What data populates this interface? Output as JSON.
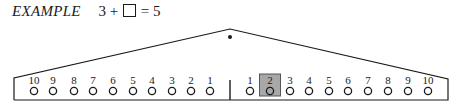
{
  "title": {
    "label": "EXAMPLE",
    "equation": {
      "left": "3",
      "op": "+",
      "blank": "□",
      "eq": "=",
      "result": "5"
    }
  },
  "balance": {
    "apex": [
      230,
      29
    ],
    "pivot_dot": [
      230,
      37
    ],
    "left_corner": [
      14,
      78
    ],
    "right_corner": [
      448,
      79
    ],
    "base_y": 100,
    "divider_x": 230,
    "highlight_color": "#a8a8a8",
    "left_pegs": [
      {
        "label": "10",
        "x": 34
      },
      {
        "label": "9",
        "x": 53
      },
      {
        "label": "8",
        "x": 74
      },
      {
        "label": "7",
        "x": 93
      },
      {
        "label": "6",
        "x": 113
      },
      {
        "label": "5",
        "x": 133
      },
      {
        "label": "4",
        "x": 152
      },
      {
        "label": "3",
        "x": 172
      },
      {
        "label": "2",
        "x": 191
      },
      {
        "label": "1",
        "x": 210
      }
    ],
    "right_pegs": [
      {
        "label": "1",
        "x": 250
      },
      {
        "label": "2",
        "x": 270,
        "highlighted": true
      },
      {
        "label": "3",
        "x": 290
      },
      {
        "label": "4",
        "x": 309
      },
      {
        "label": "5",
        "x": 329
      },
      {
        "label": "6",
        "x": 348
      },
      {
        "label": "7",
        "x": 368
      },
      {
        "label": "8",
        "x": 388
      },
      {
        "label": "9",
        "x": 408
      },
      {
        "label": "10",
        "x": 428
      }
    ]
  }
}
